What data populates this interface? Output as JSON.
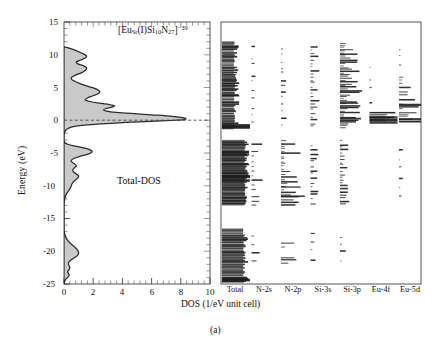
{
  "figure": {
    "caption": "(a)",
    "formula_html": "[Eu<sub>Sr</sub>(I)Si<sub>10</sub>N<sub>27</sub>]<sup>−39</sup>",
    "formula_text": "[EuSr(I)Si10N27]-39",
    "series_label": "Total-DOS",
    "xlabel": "DOS (1/eV unit cell)",
    "ylabel": "Energy (eV)",
    "fill_color": "#c9c9c9",
    "line_color": "#2b2b2b",
    "frame_color": "#555555"
  },
  "chart_data": {
    "type": "area",
    "xlabel": "DOS (1/eV unit cell)",
    "ylabel": "Energy (eV)",
    "xlim": [
      0,
      10
    ],
    "ylim": [
      -25,
      15
    ],
    "xticks": [
      0,
      2,
      4,
      6,
      8,
      10
    ],
    "yticks": [
      15,
      10,
      5,
      0,
      -5,
      -10,
      -15,
      -20,
      -25
    ],
    "grid": false,
    "fermi_level": 0,
    "orientation": "horizontal-energy-vertical",
    "series": [
      {
        "name": "Total-DOS",
        "panel": "left",
        "note": "DOS value (x) as function of Energy in eV (y)",
        "points": [
          [
            11.2,
            0.0
          ],
          [
            11.0,
            0.35
          ],
          [
            10.7,
            0.75
          ],
          [
            10.4,
            1.05
          ],
          [
            10.1,
            1.35
          ],
          [
            9.8,
            1.55
          ],
          [
            9.5,
            1.45
          ],
          [
            9.2,
            1.15
          ],
          [
            8.9,
            0.85
          ],
          [
            8.6,
            0.95
          ],
          [
            8.3,
            1.35
          ],
          [
            8.0,
            1.55
          ],
          [
            7.6,
            1.45
          ],
          [
            7.2,
            1.15
          ],
          [
            6.9,
            0.8
          ],
          [
            6.6,
            0.55
          ],
          [
            6.3,
            0.5
          ],
          [
            6.0,
            0.7
          ],
          [
            5.6,
            1.1
          ],
          [
            5.2,
            1.6
          ],
          [
            4.9,
            2.05
          ],
          [
            4.6,
            2.35
          ],
          [
            4.3,
            2.45
          ],
          [
            4.0,
            2.3
          ],
          [
            3.7,
            1.95
          ],
          [
            3.4,
            1.6
          ],
          [
            3.1,
            1.45
          ],
          [
            2.9,
            1.7
          ],
          [
            2.6,
            2.4
          ],
          [
            2.4,
            3.1
          ],
          [
            2.2,
            3.45
          ],
          [
            2.0,
            3.3
          ],
          [
            1.8,
            2.9
          ],
          [
            1.6,
            2.7
          ],
          [
            1.4,
            2.9
          ],
          [
            1.2,
            3.6
          ],
          [
            1.0,
            4.8
          ],
          [
            0.8,
            6.2
          ],
          [
            0.6,
            7.4
          ],
          [
            0.4,
            8.1
          ],
          [
            0.25,
            8.35
          ],
          [
            0.1,
            8.2
          ],
          [
            0.0,
            7.6
          ],
          [
            -0.15,
            6.3
          ],
          [
            -0.3,
            4.6
          ],
          [
            -0.5,
            2.9
          ],
          [
            -0.7,
            1.6
          ],
          [
            -0.9,
            0.85
          ],
          [
            -1.1,
            0.45
          ],
          [
            -1.3,
            0.25
          ],
          [
            -1.5,
            0.12
          ],
          [
            -1.8,
            0.05
          ],
          [
            -2.1,
            0.02
          ],
          [
            -2.5,
            0.0
          ],
          [
            -3.0,
            0.0
          ],
          [
            -3.4,
            0.05
          ],
          [
            -3.7,
            0.3
          ],
          [
            -4.0,
            0.9
          ],
          [
            -4.3,
            1.5
          ],
          [
            -4.6,
            1.85
          ],
          [
            -4.9,
            1.9
          ],
          [
            -5.2,
            1.6
          ],
          [
            -5.5,
            1.1
          ],
          [
            -5.8,
            0.7
          ],
          [
            -6.1,
            0.5
          ],
          [
            -6.4,
            0.55
          ],
          [
            -6.7,
            0.75
          ],
          [
            -7.0,
            0.85
          ],
          [
            -7.3,
            0.7
          ],
          [
            -7.6,
            0.6
          ],
          [
            -7.9,
            0.65
          ],
          [
            -8.2,
            0.85
          ],
          [
            -8.5,
            1.0
          ],
          [
            -8.8,
            0.95
          ],
          [
            -9.1,
            0.8
          ],
          [
            -9.4,
            0.65
          ],
          [
            -9.7,
            0.55
          ],
          [
            -10.0,
            0.5
          ],
          [
            -10.4,
            0.42
          ],
          [
            -10.8,
            0.3
          ],
          [
            -11.2,
            0.18
          ],
          [
            -11.6,
            0.1
          ],
          [
            -12.0,
            0.05
          ],
          [
            -12.5,
            0.02
          ],
          [
            -13.0,
            0.0
          ],
          [
            -14.0,
            0.0
          ],
          [
            -15.0,
            0.0
          ],
          [
            -16.0,
            0.0
          ],
          [
            -17.0,
            0.02
          ],
          [
            -17.6,
            0.08
          ],
          [
            -18.2,
            0.2
          ],
          [
            -18.7,
            0.4
          ],
          [
            -19.1,
            0.6
          ],
          [
            -19.5,
            0.8
          ],
          [
            -19.9,
            0.95
          ],
          [
            -20.3,
            1.0
          ],
          [
            -20.7,
            0.9
          ],
          [
            -21.0,
            0.7
          ],
          [
            -21.3,
            0.5
          ],
          [
            -21.6,
            0.35
          ],
          [
            -21.9,
            0.3
          ],
          [
            -22.2,
            0.35
          ],
          [
            -22.5,
            0.4
          ],
          [
            -22.8,
            0.35
          ],
          [
            -23.1,
            0.25
          ],
          [
            -23.4,
            0.3
          ],
          [
            -23.7,
            0.35
          ],
          [
            -24.0,
            0.25
          ],
          [
            -24.3,
            0.12
          ],
          [
            -24.6,
            0.05
          ],
          [
            -25.0,
            0.0
          ]
        ]
      }
    ],
    "projected_panel": {
      "note": "Right panel: discrete eigenvalue sticks per orbital projection",
      "columns": [
        "Total",
        "N-2s",
        "N-2p",
        "Si-3s",
        "Si-3p",
        "Eu-4f",
        "Eu-5d"
      ]
    }
  },
  "axes": {
    "left": {
      "xticks": [
        "0",
        "2",
        "4",
        "6",
        "8",
        "10"
      ],
      "yticks": [
        "15",
        "10",
        "5",
        "0",
        "-5",
        "-10",
        "-15",
        "-20",
        "-25"
      ]
    },
    "right": {
      "columns": [
        {
          "label": "Total"
        },
        {
          "label": "N-2s"
        },
        {
          "label": "N-2p"
        },
        {
          "label": "Si-3s"
        },
        {
          "label": "Si-3p"
        },
        {
          "label": "Eu-4f"
        },
        {
          "label": "Eu-5d"
        }
      ]
    }
  }
}
